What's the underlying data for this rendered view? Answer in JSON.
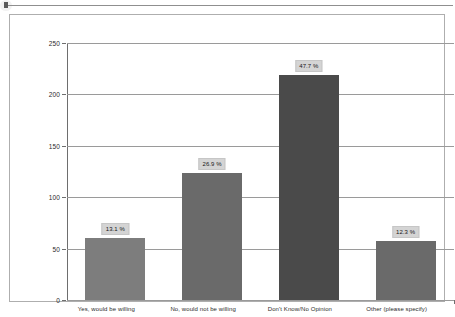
{
  "toolbar": {
    "cursor_name": "text-cursor"
  },
  "chart_data": {
    "type": "bar",
    "title": "",
    "subtitle": "",
    "xlabel": "",
    "ylabel": "",
    "categories": [
      "Yes, would be willing",
      "No, would not be willing",
      "Don't Know/No Opinion",
      "Other (please specify)"
    ],
    "values": [
      60,
      124,
      219,
      57
    ],
    "data_labels": [
      "13.1 %",
      "26.9 %",
      "47.7 %",
      "12.3 %"
    ],
    "percentages": [
      13.1,
      26.9,
      47.7,
      12.3
    ],
    "bar_colors": [
      "#7d7d7d",
      "#6a6a6a",
      "#4a4a4a",
      "#6a6a6a"
    ],
    "ylim": [
      0,
      250
    ],
    "yticks": [
      0,
      50,
      100,
      150,
      200,
      250
    ],
    "ytick_labels": [
      "0",
      "50",
      "100",
      "150",
      "200",
      "250"
    ],
    "grid": true,
    "grid_axis": "y",
    "legend": false,
    "legend_position": "none",
    "label_box_color": "#d4d4d4",
    "axis_color": "#6e6e6e",
    "gridline_color": "#9a9a9a",
    "plot_background": "#ffffff",
    "frame_border_color": "#aeaeae"
  }
}
